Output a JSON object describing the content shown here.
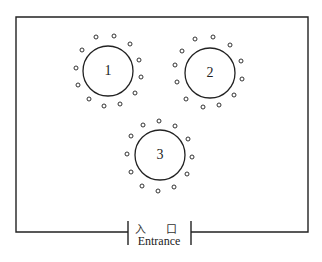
{
  "diagram": {
    "room": {
      "left": 16,
      "top": 17,
      "right": 308,
      "bottom": 232,
      "stroke": "#222"
    },
    "entrance": {
      "label_cn": "入 口",
      "label_en": "Entrance",
      "gap_left": 128,
      "gap_right": 191
    },
    "tables": [
      {
        "label": "1",
        "cx": 108,
        "cy": 71,
        "r": 25,
        "chairs": [
          [
            96,
            37
          ],
          [
            114,
            36
          ],
          [
            130,
            44
          ],
          [
            82,
            50
          ],
          [
            139,
            60
          ],
          [
            76,
            68
          ],
          [
            141,
            77
          ],
          [
            78,
            85
          ],
          [
            135,
            93
          ],
          [
            89,
            99
          ],
          [
            104,
            106
          ],
          [
            120,
            104
          ]
        ]
      },
      {
        "label": "2",
        "cx": 210,
        "cy": 73,
        "r": 25,
        "chairs": [
          [
            195,
            39
          ],
          [
            213,
            37
          ],
          [
            230,
            45
          ],
          [
            182,
            51
          ],
          [
            241,
            61
          ],
          [
            175,
            65
          ],
          [
            242,
            79
          ],
          [
            177,
            82
          ],
          [
            234,
            95
          ],
          [
            186,
            99
          ],
          [
            203,
            107
          ],
          [
            219,
            105
          ]
        ]
      },
      {
        "label": "3",
        "cx": 160,
        "cy": 155,
        "r": 25,
        "chairs": [
          [
            143,
            125
          ],
          [
            159,
            121
          ],
          [
            175,
            126
          ],
          [
            131,
            136
          ],
          [
            188,
            139
          ],
          [
            127,
            154
          ],
          [
            192,
            157
          ],
          [
            131,
            172
          ],
          [
            187,
            174
          ],
          [
            142,
            186
          ],
          [
            158,
            191
          ],
          [
            174,
            187
          ]
        ]
      }
    ]
  }
}
